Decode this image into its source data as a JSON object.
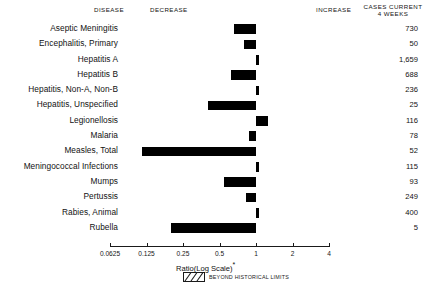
{
  "header": {
    "disease": "DISEASE",
    "decrease": "DECREASE",
    "increase": "INCREASE",
    "cases_line1": "CASES CURRENT",
    "cases_line2": "4 WEEKS"
  },
  "axis": {
    "title": "Ratio(Log Scale)",
    "title_marker": "*",
    "tick_labels": [
      "0.0625",
      "0.125",
      "0.25",
      "0.5",
      "1",
      "2",
      "4"
    ],
    "tick_values": [
      0.0625,
      0.125,
      0.25,
      0.5,
      1,
      2,
      4
    ],
    "legend_label": "BEYOND HISTORICAL LIMITS",
    "legend_pattern": "hatched-swatch"
  },
  "chart_data": {
    "type": "bar",
    "orientation": "horizontal",
    "title": "",
    "subtitle": "",
    "xlabel": "Ratio(Log Scale)",
    "ylabel": "DISEASE",
    "xscale": "log",
    "xlim": [
      0.0625,
      4
    ],
    "baseline": 1,
    "grid": false,
    "legend_position": "below-axis",
    "bar_color": "#000000",
    "categories": [
      "Aseptic Meningitis",
      "Encephalitis, Primary",
      "Hepatitis A",
      "Hepatitis B",
      "Hepatitis, Non-A, Non-B",
      "Hepatitis, Unspecified",
      "Legionellosis",
      "Malaria",
      "Measles, Total",
      "Meningococcal Infections",
      "Mumps",
      "Pertussis",
      "Rabies, Animal",
      "Rubella"
    ],
    "values": [
      0.66,
      0.79,
      1.06,
      0.62,
      1.03,
      0.4,
      1.25,
      0.88,
      0.115,
      1.0,
      0.54,
      0.82,
      1.02,
      0.2
    ],
    "cases_current_4_weeks": [
      "730",
      "50",
      "1,659",
      "688",
      "236",
      "25",
      "116",
      "78",
      "52",
      "115",
      "93",
      "249",
      "400",
      "5"
    ],
    "rows": [
      {
        "label": "Aseptic Meningitis",
        "ratio": 0.66,
        "direction": "decrease",
        "cases": "730"
      },
      {
        "label": "Encephalitis, Primary",
        "ratio": 0.79,
        "direction": "decrease",
        "cases": "50"
      },
      {
        "label": "Hepatitis A",
        "ratio": 1.06,
        "direction": "increase",
        "cases": "1,659"
      },
      {
        "label": "Hepatitis B",
        "ratio": 0.62,
        "direction": "decrease",
        "cases": "688"
      },
      {
        "label": "Hepatitis, Non-A, Non-B",
        "ratio": 1.03,
        "direction": "increase",
        "cases": "236"
      },
      {
        "label": "Hepatitis, Unspecified",
        "ratio": 0.4,
        "direction": "decrease",
        "cases": "25"
      },
      {
        "label": "Legionellosis",
        "ratio": 1.25,
        "direction": "increase",
        "cases": "116"
      },
      {
        "label": "Malaria",
        "ratio": 0.88,
        "direction": "decrease",
        "cases": "78"
      },
      {
        "label": "Measles, Total",
        "ratio": 0.115,
        "direction": "decrease",
        "cases": "52"
      },
      {
        "label": "Meningococcal Infections",
        "ratio": 1.0,
        "direction": "none",
        "cases": "115"
      },
      {
        "label": "Mumps",
        "ratio": 0.54,
        "direction": "decrease",
        "cases": "93"
      },
      {
        "label": "Pertussis",
        "ratio": 0.82,
        "direction": "decrease",
        "cases": "249"
      },
      {
        "label": "Rabies, Animal",
        "ratio": 1.02,
        "direction": "increase",
        "cases": "400"
      },
      {
        "label": "Rubella",
        "ratio": 0.2,
        "direction": "decrease",
        "cases": "5"
      }
    ]
  }
}
